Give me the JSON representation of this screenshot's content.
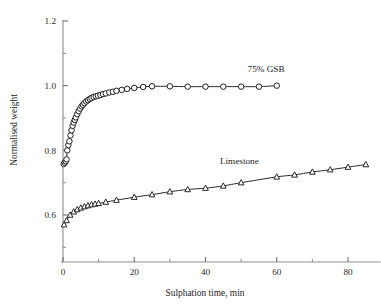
{
  "chart_data": {
    "type": "scatter",
    "title": "",
    "xlabel": "Sulphation time, min",
    "ylabel": "Normalised weight",
    "xlim": [
      0,
      88
    ],
    "ylim": [
      0.5,
      1.2
    ],
    "grid": false,
    "legend_position": "inline-annotation",
    "x_ticks_major": [
      0,
      20,
      40,
      60,
      80
    ],
    "x_tick_labels": [
      "0",
      "20",
      "40",
      "60",
      "80"
    ],
    "x_ticks_minor": [
      10,
      30,
      50,
      70
    ],
    "y_ticks_major": [
      0.6,
      0.8,
      1.0,
      1.2
    ],
    "y_tick_labels": [
      "0.6",
      "0.8",
      "1.0",
      "1.2"
    ],
    "y_ticks_minor": [
      0.5,
      0.7,
      0.9,
      1.1
    ],
    "series": [
      {
        "name": "75% GSB",
        "marker": "circle",
        "annotation": "75% GSB",
        "annotation_x": 57.0,
        "annotation_y": 1.043,
        "points": [
          {
            "x": 0.2,
            "y": 0.758
          },
          {
            "x": 0.5,
            "y": 0.762
          },
          {
            "x": 0.8,
            "y": 0.766
          },
          {
            "x": 1.0,
            "y": 0.772
          },
          {
            "x": 1.2,
            "y": 0.8
          },
          {
            "x": 1.5,
            "y": 0.816
          },
          {
            "x": 1.8,
            "y": 0.828
          },
          {
            "x": 2.1,
            "y": 0.846
          },
          {
            "x": 2.4,
            "y": 0.862
          },
          {
            "x": 2.7,
            "y": 0.876
          },
          {
            "x": 3.0,
            "y": 0.886
          },
          {
            "x": 3.3,
            "y": 0.894
          },
          {
            "x": 3.6,
            "y": 0.902
          },
          {
            "x": 4.0,
            "y": 0.912
          },
          {
            "x": 4.4,
            "y": 0.921
          },
          {
            "x": 4.8,
            "y": 0.929
          },
          {
            "x": 5.2,
            "y": 0.936
          },
          {
            "x": 5.6,
            "y": 0.941
          },
          {
            "x": 6.0,
            "y": 0.946
          },
          {
            "x": 6.5,
            "y": 0.951
          },
          {
            "x": 7.0,
            "y": 0.955
          },
          {
            "x": 7.5,
            "y": 0.959
          },
          {
            "x": 8.0,
            "y": 0.962
          },
          {
            "x": 8.6,
            "y": 0.965
          },
          {
            "x": 9.2,
            "y": 0.967
          },
          {
            "x": 9.8,
            "y": 0.969
          },
          {
            "x": 10.5,
            "y": 0.971
          },
          {
            "x": 11.2,
            "y": 0.974
          },
          {
            "x": 12.0,
            "y": 0.976
          },
          {
            "x": 13.0,
            "y": 0.979
          },
          {
            "x": 14.0,
            "y": 0.981
          },
          {
            "x": 15.0,
            "y": 0.984
          },
          {
            "x": 16.5,
            "y": 0.987
          },
          {
            "x": 18.0,
            "y": 0.99
          },
          {
            "x": 20.0,
            "y": 0.993
          },
          {
            "x": 22.5,
            "y": 0.996
          },
          {
            "x": 25.0,
            "y": 0.998
          },
          {
            "x": 30.0,
            "y": 0.998
          },
          {
            "x": 35.0,
            "y": 0.997
          },
          {
            "x": 40.0,
            "y": 0.997
          },
          {
            "x": 45.0,
            "y": 0.997
          },
          {
            "x": 50.0,
            "y": 0.997
          },
          {
            "x": 55.0,
            "y": 0.997
          },
          {
            "x": 60.0,
            "y": 1.0
          }
        ]
      },
      {
        "name": "Limestone",
        "marker": "triangle",
        "annotation": "Limestone",
        "annotation_x": 49.5,
        "annotation_y": 0.757,
        "points": [
          {
            "x": 0.3,
            "y": 0.57
          },
          {
            "x": 1.0,
            "y": 0.583
          },
          {
            "x": 2.0,
            "y": 0.6
          },
          {
            "x": 3.0,
            "y": 0.61
          },
          {
            "x": 4.0,
            "y": 0.617
          },
          {
            "x": 5.0,
            "y": 0.622
          },
          {
            "x": 6.0,
            "y": 0.626
          },
          {
            "x": 7.0,
            "y": 0.629
          },
          {
            "x": 8.0,
            "y": 0.632
          },
          {
            "x": 9.0,
            "y": 0.634
          },
          {
            "x": 10.0,
            "y": 0.636
          },
          {
            "x": 12.0,
            "y": 0.64
          },
          {
            "x": 15.0,
            "y": 0.646
          },
          {
            "x": 20.0,
            "y": 0.655
          },
          {
            "x": 25.0,
            "y": 0.663
          },
          {
            "x": 30.0,
            "y": 0.672
          },
          {
            "x": 35.0,
            "y": 0.679
          },
          {
            "x": 40.0,
            "y": 0.683
          },
          {
            "x": 45.0,
            "y": 0.69
          },
          {
            "x": 50.0,
            "y": 0.7
          },
          {
            "x": 60.0,
            "y": 0.718
          },
          {
            "x": 65.0,
            "y": 0.724
          },
          {
            "x": 70.0,
            "y": 0.733
          },
          {
            "x": 75.0,
            "y": 0.74
          },
          {
            "x": 80.0,
            "y": 0.748
          },
          {
            "x": 85.0,
            "y": 0.756
          }
        ]
      }
    ]
  }
}
